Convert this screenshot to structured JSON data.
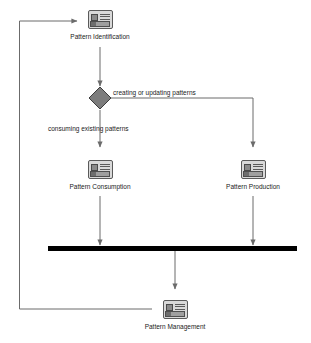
{
  "diagram": {
    "type": "activity-flow-diagram",
    "canvas": {
      "width": 311,
      "height": 343,
      "background": "#ffffff"
    },
    "colors": {
      "line": "#6b6b6b",
      "decision_fill": "#7d7d7d",
      "decision_stroke": "#3c3c3c",
      "bar": "#000000",
      "icon_fill": "#d9d9d9",
      "icon_stroke": "#5a5a5a",
      "text": "#1a1a1a"
    },
    "nodes": [
      {
        "id": "pattern-identification",
        "label": "Pattern Identification",
        "icon": "use-case-icon",
        "x": 100,
        "y": 10
      },
      {
        "id": "pattern-consumption",
        "label": "Pattern Consumption",
        "icon": "use-case-icon",
        "x": 100,
        "y": 160
      },
      {
        "id": "pattern-production",
        "label": "Pattern Production",
        "icon": "use-case-icon",
        "x": 253,
        "y": 160
      },
      {
        "id": "pattern-management",
        "label": "Pattern Management",
        "icon": "use-case-icon",
        "x": 175,
        "y": 300
      }
    ],
    "decision": {
      "id": "creating-or-updating-decision",
      "x": 100,
      "y": 98,
      "size": 22
    },
    "join_bar": {
      "id": "synchronization-bar",
      "x": 48,
      "y": 246,
      "width": 249,
      "height": 5
    },
    "edge_labels": [
      {
        "id": "label-creating-updating",
        "text": "creating or updating patterns",
        "x": 113,
        "y": 88
      },
      {
        "id": "label-consuming-existing",
        "text": "consuming existing patterns",
        "x": 48,
        "y": 124
      }
    ]
  }
}
